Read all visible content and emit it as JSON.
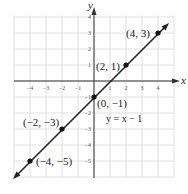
{
  "chart_data": {
    "type": "line",
    "title": "",
    "xlabel": "x",
    "ylabel": "y",
    "xlim": [
      -5,
      5
    ],
    "ylim": [
      -6,
      4
    ],
    "grid": true,
    "x_ticks": [
      -4,
      -3,
      -2,
      -1,
      1,
      2,
      3,
      4
    ],
    "y_ticks": [
      4,
      3,
      2,
      1,
      -1,
      -2,
      -3,
      -4,
      -5
    ],
    "series": [
      {
        "name": "y = x − 1",
        "equation": "y = x − 1",
        "x": [
          -4,
          -2,
          0,
          2,
          4
        ],
        "y": [
          -5,
          -3,
          -1,
          1,
          3
        ]
      }
    ],
    "annotations": [
      {
        "text": "(4, 3)",
        "x": 4,
        "y": 3
      },
      {
        "text": "(2, 1)",
        "x": 2,
        "y": 1
      },
      {
        "text": "(0, −1)",
        "x": 0,
        "y": -1
      },
      {
        "text": "(−2, −3)",
        "x": -2,
        "y": -3
      },
      {
        "text": "(−4, −5)",
        "x": -4,
        "y": -5
      },
      {
        "text": "y = x − 1",
        "x": 0.5,
        "y": -2
      }
    ],
    "colors": {
      "line": "#222222",
      "grid": "#d8d8d8",
      "axis": "#333333",
      "point": "#111111"
    }
  },
  "labels": {
    "x_axis": "x",
    "y_axis": "y",
    "equation": "y = x − 1",
    "points": [
      "(4, 3)",
      "(2, 1)",
      "(0, −1)",
      "(−2, −3)",
      "(−4, −5)"
    ],
    "x_ticks": [
      "−4",
      "−3",
      "−2",
      "−1",
      "1",
      "2",
      "3",
      "4"
    ],
    "y_ticks": [
      "4",
      "3",
      "2",
      "1",
      "−1",
      "−2",
      "−3",
      "−4",
      "−5"
    ]
  }
}
